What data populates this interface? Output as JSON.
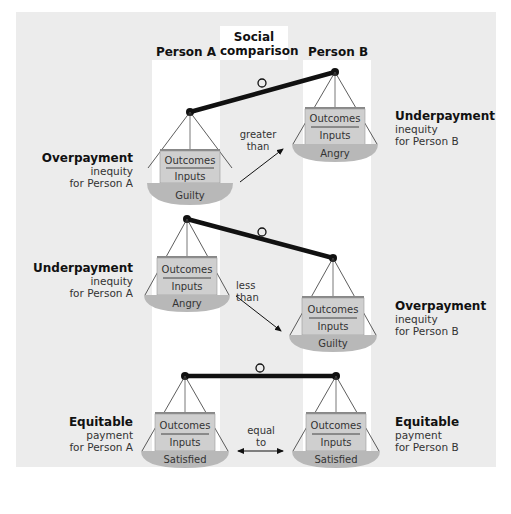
{
  "headers": {
    "person_a": "Person A",
    "social_comparison_line1": "Social",
    "social_comparison_line2": "comparison",
    "person_b": "Person B"
  },
  "rows": [
    {
      "a": {
        "title": "Overpayment",
        "line2": "inequity",
        "line3": "for Person A",
        "ratio_top": "Outcomes",
        "ratio_bottom": "Inputs",
        "feeling": "Guilty"
      },
      "comparison": {
        "line1": "greater",
        "line2": "than"
      },
      "b": {
        "title": "Underpayment",
        "line2": "inequity",
        "line3": "for Person B",
        "ratio_top": "Outcomes",
        "ratio_bottom": "Inputs",
        "feeling": "Angry"
      }
    },
    {
      "a": {
        "title": "Underpayment",
        "line2": "inequity",
        "line3": "for Person A",
        "ratio_top": "Outcomes",
        "ratio_bottom": "Inputs",
        "feeling": "Angry"
      },
      "comparison": {
        "line1": "less",
        "line2": "than"
      },
      "b": {
        "title": "Overpayment",
        "line2": "inequity",
        "line3": "for Person B",
        "ratio_top": "Outcomes",
        "ratio_bottom": "Inputs",
        "feeling": "Guilty"
      }
    },
    {
      "a": {
        "title": "Equitable",
        "line2": "payment",
        "line3": "for Person A",
        "ratio_top": "Outcomes",
        "ratio_bottom": "Inputs",
        "feeling": "Satisfied"
      },
      "comparison": {
        "line1": "equal",
        "line2": "to"
      },
      "b": {
        "title": "Equitable",
        "line2": "payment",
        "line3": "for Person B",
        "ratio_top": "Outcomes",
        "ratio_bottom": "Inputs",
        "feeling": "Satisfied"
      }
    }
  ],
  "colors": {
    "panel_bg": "#ececec",
    "column_bg": "#ffffff",
    "box_fill": "#cfcfcf",
    "pan_fill": "#b8b8b8",
    "beam": "#111111"
  }
}
